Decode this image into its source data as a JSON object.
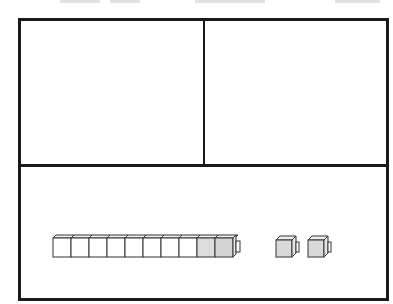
{
  "diagram": {
    "type": "place-value mat with base-ten blocks",
    "frame": {
      "border_color": "#1a1a1a",
      "background": "#ffffff"
    },
    "regions": [
      {
        "name": "top-left-box",
        "content": "empty"
      },
      {
        "name": "top-right-box",
        "content": "empty"
      },
      {
        "name": "bottom-box",
        "content": "base-ten blocks"
      }
    ],
    "blocks": {
      "ten_rod": {
        "cube_count": 10,
        "shaded_cubes": 2,
        "cube_fill": "#ffffff",
        "shaded_fill": "#d9d9d9"
      },
      "unit_cubes": {
        "count": 2,
        "fill": "#d9d9d9"
      }
    },
    "heading_cut_off": true
  }
}
